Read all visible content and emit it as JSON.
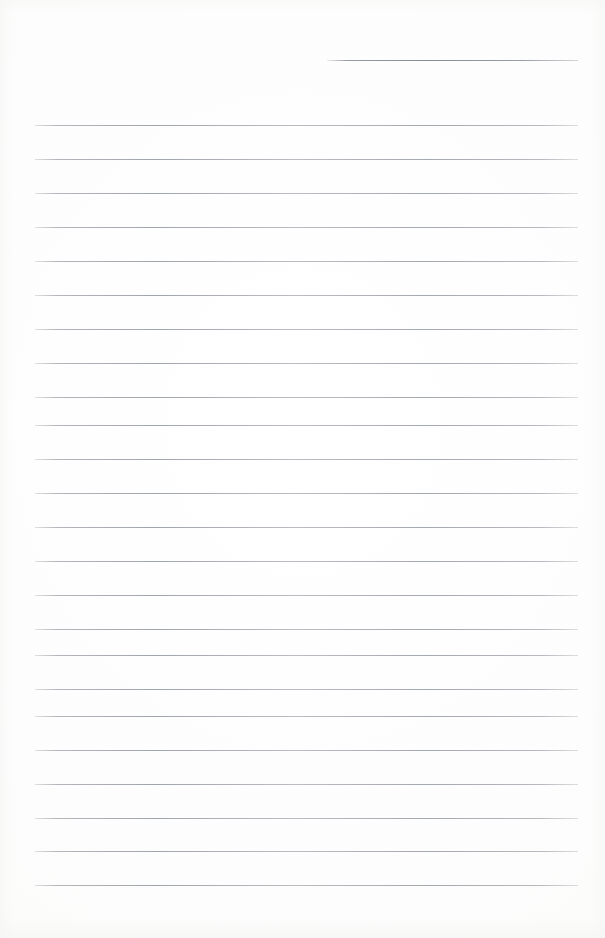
{
  "document": {
    "kind": "scanned-lined-notebook-page",
    "title": "Blank Ruled Notebook Page",
    "page_width": 605,
    "page_height": 938,
    "orientation": "portrait",
    "content_text": "",
    "is_blank": true
  },
  "colors": {
    "paper": "#fdfdfc",
    "rule_line": "#9096a0",
    "ghost_ink": "#787e86",
    "page_border": "#f5f5f4"
  },
  "ruling": {
    "style": "wide-ruled",
    "line_count": 24,
    "full_width_line_count": 23,
    "partial_line_count": 1,
    "line_spacing_px": 34,
    "line_thickness_px": 1,
    "left_margin_px": 35,
    "right_margin_px": 578,
    "has_vertical_margin_rule": false,
    "lines": [
      {
        "index": 1,
        "y": 60,
        "x1": 327,
        "x2": 578,
        "partial": true
      },
      {
        "index": 2,
        "y": 125,
        "x1": 35,
        "x2": 578,
        "partial": false
      },
      {
        "index": 3,
        "y": 159,
        "x1": 35,
        "x2": 578,
        "partial": false
      },
      {
        "index": 4,
        "y": 193,
        "x1": 35,
        "x2": 578,
        "partial": false
      },
      {
        "index": 5,
        "y": 227,
        "x1": 35,
        "x2": 578,
        "partial": false
      },
      {
        "index": 6,
        "y": 261,
        "x1": 35,
        "x2": 578,
        "partial": false
      },
      {
        "index": 7,
        "y": 295,
        "x1": 35,
        "x2": 578,
        "partial": false
      },
      {
        "index": 8,
        "y": 329,
        "x1": 35,
        "x2": 578,
        "partial": false
      },
      {
        "index": 9,
        "y": 363,
        "x1": 35,
        "x2": 578,
        "partial": false
      },
      {
        "index": 10,
        "y": 397,
        "x1": 35,
        "x2": 578,
        "partial": false
      },
      {
        "index": 11,
        "y": 425,
        "x1": 35,
        "x2": 578,
        "partial": false
      },
      {
        "index": 12,
        "y": 459,
        "x1": 35,
        "x2": 578,
        "partial": false
      },
      {
        "index": 13,
        "y": 493,
        "x1": 35,
        "x2": 578,
        "partial": false
      },
      {
        "index": 14,
        "y": 527,
        "x1": 35,
        "x2": 578,
        "partial": false
      },
      {
        "index": 15,
        "y": 561,
        "x1": 35,
        "x2": 578,
        "partial": false
      },
      {
        "index": 16,
        "y": 595,
        "x1": 35,
        "x2": 578,
        "partial": false
      },
      {
        "index": 17,
        "y": 629,
        "x1": 35,
        "x2": 578,
        "partial": false
      },
      {
        "index": 18,
        "y": 655,
        "x1": 35,
        "x2": 578,
        "partial": false
      },
      {
        "index": 19,
        "y": 689,
        "x1": 35,
        "x2": 578,
        "partial": false
      },
      {
        "index": 20,
        "y": 716,
        "x1": 35,
        "x2": 578,
        "partial": false
      },
      {
        "index": 21,
        "y": 750,
        "x1": 35,
        "x2": 578,
        "partial": false
      },
      {
        "index": 22,
        "y": 784,
        "x1": 35,
        "x2": 578,
        "partial": false
      },
      {
        "index": 23,
        "y": 818,
        "x1": 35,
        "x2": 578,
        "partial": false
      },
      {
        "index": 24,
        "y": 851,
        "x1": 35,
        "x2": 578,
        "partial": false
      },
      {
        "index": 25,
        "y": 885,
        "x1": 35,
        "x2": 578,
        "partial": false
      }
    ]
  },
  "artifacts": {
    "description": "faint show-through ink from the reverse side of the sheet; not legible",
    "ghost_top_text": "illegible",
    "ghost_bottom_text": "illegible smudged line",
    "ghost_bottom_secondary_text": "illegible"
  }
}
